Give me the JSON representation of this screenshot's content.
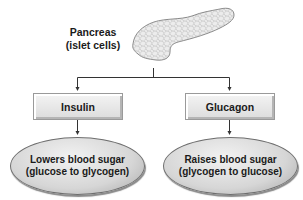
{
  "diagram": {
    "source": {
      "label_line1": "Pancreas",
      "label_line2": "(islet cells)",
      "icon": "pancreas-illustration"
    },
    "hormones": [
      {
        "name": "Insulin",
        "effect_line1": "Lowers blood sugar",
        "effect_line2": "(glucose to glycogen)"
      },
      {
        "name": "Glucagon",
        "effect_line1": "Raises blood sugar",
        "effect_line2": "(glycogen to glucose)"
      }
    ],
    "colors": {
      "box_fill": "#e6e6e6",
      "ellipse_fill": "#d6d6d6",
      "line": "#333333",
      "text": "#1a1a1a"
    }
  }
}
